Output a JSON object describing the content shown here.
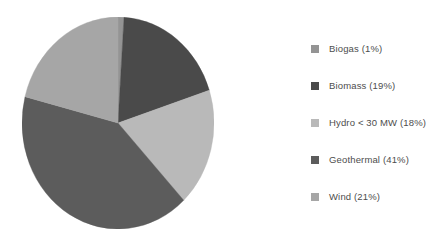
{
  "chart_data": {
    "type": "pie",
    "title": "",
    "subtitle": "",
    "xlabel": "",
    "ylabel": "",
    "grid": false,
    "legend_position": "right",
    "start_angle_deg": 0,
    "direction": "clockwise",
    "categories": [
      "Biogas",
      "Biomass",
      "Hydro < 30 MW",
      "Geothermal",
      "Wind"
    ],
    "values": [
      1,
      19,
      18,
      41,
      21
    ],
    "unit": "%",
    "total": 100,
    "colors": [
      "#949494",
      "#4a4a4a",
      "#b9b9b9",
      "#5c5c5c",
      "#a6a6a6"
    ],
    "slices": [
      {
        "label": "Biogas",
        "value": 1,
        "color": "#949494"
      },
      {
        "label": "Biomass",
        "value": 19,
        "color": "#4a4a4a"
      },
      {
        "label": "Hydro < 30 MW",
        "value": 18,
        "color": "#b9b9b9"
      },
      {
        "label": "Geothermal",
        "value": 41,
        "color": "#5c5c5c"
      },
      {
        "label": "Wind",
        "value": 21,
        "color": "#a6a6a6"
      }
    ]
  },
  "legend": {
    "items": [
      {
        "label": "Biogas (1%)",
        "color": "#949494"
      },
      {
        "label": "Biomass (19%)",
        "color": "#4a4a4a"
      },
      {
        "label": "Hydro < 30 MW (18%)",
        "color": "#b9b9b9"
      },
      {
        "label": "Geothermal (41%)",
        "color": "#5c5c5c"
      },
      {
        "label": "Wind (21%)",
        "color": "#a6a6a6"
      }
    ]
  },
  "figure": {
    "background": "#ffffff",
    "text_color": "#4d4d4d"
  }
}
